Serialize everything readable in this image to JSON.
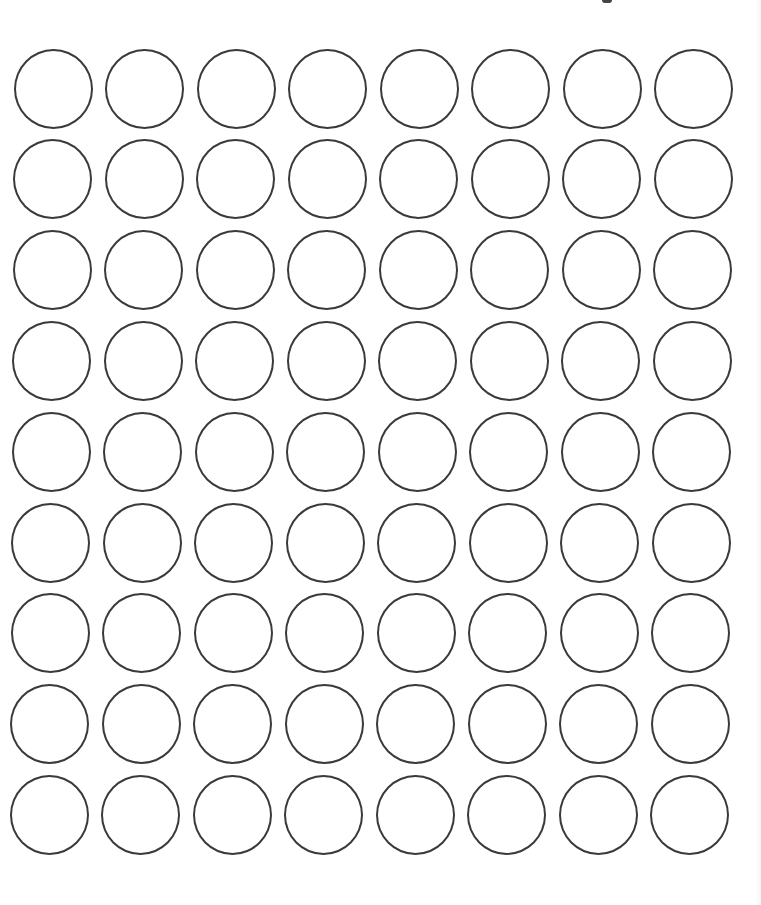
{
  "document": {
    "type": "blank round label sheet",
    "background_color": "#ffffff",
    "stroke_color": "#3a3a3a"
  },
  "label_grid": {
    "columns": 8,
    "rows": 9,
    "total_labels": 72,
    "circle_diameter_px": 79,
    "column_pitch_px": 91.5,
    "row_pitch_px": 90.8,
    "first_center_x": 53,
    "first_center_y": 88,
    "row_x_drift_px": -0.5,
    "labels": []
  }
}
